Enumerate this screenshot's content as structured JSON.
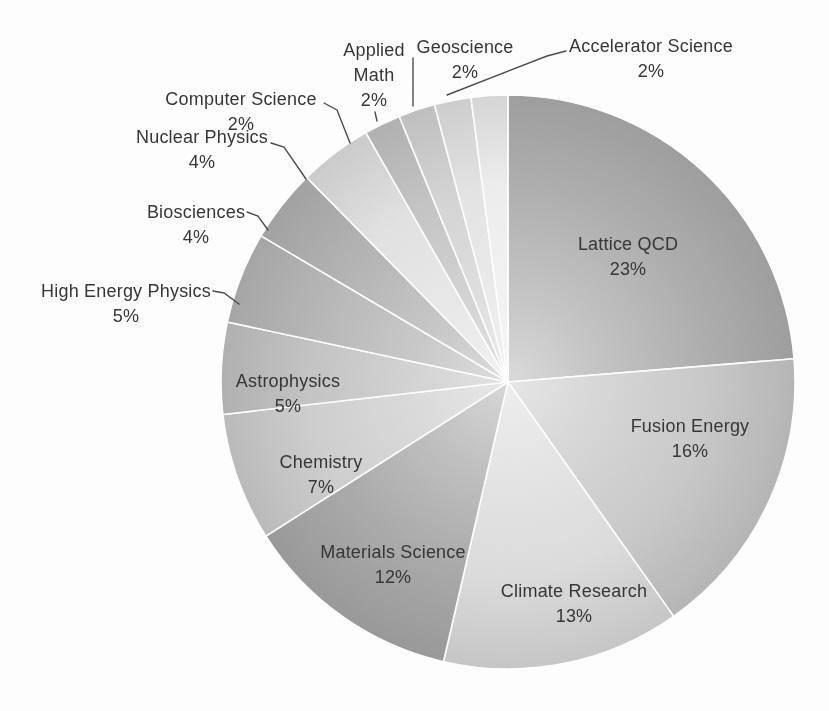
{
  "page": {
    "background": "#ffffff"
  },
  "chart_data": {
    "type": "pie",
    "title": "",
    "unit": "%",
    "legend": "none",
    "labeled_total": 97,
    "slices": [
      {
        "label": "Lattice QCD",
        "value": 23,
        "color": "#aeaeae",
        "label_placement": "inside",
        "label_lines": [
          "Lattice QCD"
        ],
        "label_anchor": {
          "x": 628,
          "y": 245
        }
      },
      {
        "label": "Fusion Energy",
        "value": 16,
        "color": "#c9c9c9",
        "label_placement": "inside",
        "label_lines": [
          "Fusion Energy"
        ],
        "label_anchor": {
          "x": 690,
          "y": 427
        }
      },
      {
        "label": "Climate Research",
        "value": 13,
        "color": "#dcdcdc",
        "label_placement": "inside",
        "label_lines": [
          "Climate Research"
        ],
        "label_anchor": {
          "x": 574,
          "y": 592
        }
      },
      {
        "label": "Materials Science",
        "value": 12,
        "color": "#a9a9a9",
        "label_placement": "inside",
        "label_lines": [
          "Materials Science"
        ],
        "label_anchor": {
          "x": 393,
          "y": 553
        }
      },
      {
        "label": "Chemistry",
        "value": 7,
        "color": "#cfcfcf",
        "label_placement": "inside",
        "label_lines": [
          "Chemistry"
        ],
        "label_anchor": {
          "x": 321,
          "y": 463
        }
      },
      {
        "label": "Astrophysics",
        "value": 5,
        "color": "#c4c4c4",
        "label_placement": "inside",
        "label_lines": [
          "Astrophysics"
        ],
        "label_anchor": {
          "x": 288,
          "y": 382
        }
      },
      {
        "label": "High Energy Physics",
        "value": 5,
        "color": "#b7b7b7",
        "label_placement": "outside",
        "label_lines": [
          "High Energy Physics"
        ],
        "label_anchor": {
          "x": 126,
          "y": 292
        },
        "leader": [
          [
            213,
            291
          ],
          [
            224,
            293
          ],
          [
            239,
            304
          ]
        ]
      },
      {
        "label": "Biosciences",
        "value": 4,
        "color": "#b3b3b3",
        "label_placement": "outside",
        "label_lines": [
          "Biosciences"
        ],
        "label_anchor": {
          "x": 196,
          "y": 213
        },
        "leader": [
          [
            247,
            212
          ],
          [
            258,
            216
          ],
          [
            268,
            230
          ]
        ]
      },
      {
        "label": "Nuclear Physics",
        "value": 4,
        "color": "#e2e2e2",
        "label_placement": "outside",
        "label_lines": [
          "Nuclear Physics"
        ],
        "label_anchor": {
          "x": 202,
          "y": 138
        },
        "leader": [
          [
            271,
            143
          ],
          [
            284,
            147
          ],
          [
            306,
            179
          ]
        ]
      },
      {
        "label": "Computer Science",
        "value": 2,
        "color": "#c4c4c4",
        "label_placement": "outside",
        "label_lines": [
          "Computer Science"
        ],
        "label_anchor": {
          "x": 241,
          "y": 100
        },
        "leader": [
          [
            324,
            103
          ],
          [
            337,
            110
          ],
          [
            350,
            143
          ]
        ]
      },
      {
        "label": "Applied Math",
        "value": 2,
        "color": "#d4d4d4",
        "label_placement": "outside",
        "label_lines": [
          "Applied",
          "Math"
        ],
        "label_anchor": {
          "x": 374,
          "y": 51
        },
        "leader": [
          [
            375,
            112
          ],
          [
            377,
            121
          ]
        ]
      },
      {
        "label": "Geoscience",
        "value": 2,
        "color": "#e4e4e4",
        "label_placement": "outside",
        "label_lines": [
          "Geoscience"
        ],
        "label_anchor": {
          "x": 465,
          "y": 48
        },
        "leader": [
          [
            413,
            58
          ],
          [
            413,
            106
          ]
        ]
      },
      {
        "label": "Accelerator Science",
        "value": 2,
        "color": "#eeeeee",
        "label_placement": "outside",
        "label_lines": [
          "Accelerator Science"
        ],
        "label_anchor": {
          "x": 651,
          "y": 47
        },
        "leader": [
          [
            566,
            51
          ],
          [
            547,
            56
          ],
          [
            447,
            95
          ]
        ]
      }
    ],
    "layout": {
      "width": 829,
      "height": 711,
      "center": {
        "x": 508,
        "y": 382
      },
      "radius": 287,
      "start_angle_deg": 0,
      "direction": "clockwise",
      "slice_border_color": "#ffffff",
      "leader_color": "#4a4a4a",
      "text_color": "#333333",
      "font_size": 18,
      "line_height": 25,
      "grid": "off"
    }
  }
}
